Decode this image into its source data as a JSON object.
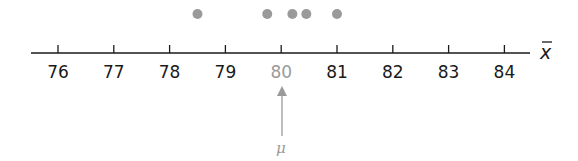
{
  "chart_data": {
    "type": "scatter",
    "title": "",
    "xlabel": "x̄",
    "ylabel": "",
    "x_ticks": [
      76,
      77,
      78,
      79,
      80,
      81,
      82,
      83,
      84
    ],
    "xlim": [
      75.9,
      84.6
    ],
    "grid": false,
    "series": [
      {
        "name": "sample means",
        "x": [
          78.5,
          79.75,
          80.2,
          80.45,
          81.0
        ],
        "color": "#9a9a9a"
      }
    ],
    "annotations": [
      {
        "text": "μ",
        "x": 80,
        "type": "arrow-up",
        "color": "#9a9a9a"
      }
    ],
    "highlighted_tick": 80
  },
  "axis": {
    "variable_label": "x",
    "mu_label": "μ",
    "tick_labels": [
      "76",
      "77",
      "78",
      "79",
      "80",
      "81",
      "82",
      "83",
      "84"
    ]
  },
  "colors": {
    "axis": "#1a1a1a",
    "dot": "#9a9a9a",
    "highlight": "#9a9a9a"
  }
}
